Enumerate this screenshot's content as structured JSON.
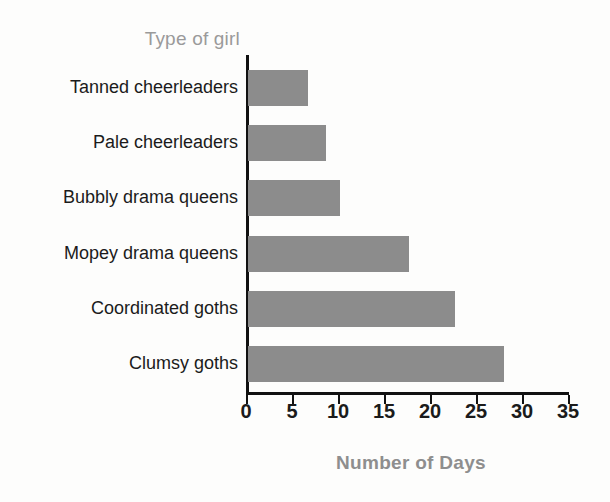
{
  "chart_data": {
    "type": "bar",
    "orientation": "horizontal",
    "title": "",
    "xlabel": "Number of Days",
    "ylabel": "Type of girl",
    "categories": [
      "Tanned cheerleaders",
      "Pale cheerleaders",
      "Bubbly drama queens",
      "Mopey drama queens",
      "Coordinated goths",
      "Clumsy goths"
    ],
    "values": [
      6.5,
      8.5,
      10,
      17.5,
      22.5,
      27.8
    ],
    "xlim": [
      0,
      35
    ],
    "xticks": [
      0,
      5,
      10,
      15,
      20,
      25,
      30,
      35
    ],
    "xtick_labels": [
      "0",
      "5",
      "10",
      "15",
      "20",
      "25",
      "30",
      "35"
    ],
    "grid": false,
    "legend": false,
    "bar_color": "#8c8c8c",
    "axis_color": "#111111",
    "label_color": "#1b1b1b",
    "axis_title_color": "#8e8e8e"
  }
}
